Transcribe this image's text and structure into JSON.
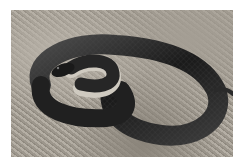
{
  "image": {
    "subject": "coiled black snake on gravelly ground",
    "colors": {
      "background": "#ffffff",
      "ground": "#a8a298",
      "snake_body": "#1c1c1c",
      "snake_highlight": "#5a5a5a",
      "belly": "#cfcac0"
    }
  }
}
